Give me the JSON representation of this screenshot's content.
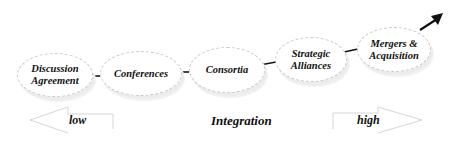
{
  "diagram": {
    "nodes": [
      {
        "id": "discussion",
        "line1": "Discussion",
        "line2": "Agreement"
      },
      {
        "id": "conferences",
        "line1": "Conferences",
        "line2": ""
      },
      {
        "id": "consortia",
        "line1": "Consortia",
        "line2": ""
      },
      {
        "id": "strategic",
        "line1": "Strategic",
        "line2": "Alliances"
      },
      {
        "id": "mergers",
        "line1": "Mergers &",
        "line2": "Acquisition"
      }
    ],
    "axis": {
      "low_label": "low",
      "center_label": "Integration",
      "high_label": "high"
    },
    "colors": {
      "text": "#111111",
      "connector": "#111111",
      "outline": "#c8c8c8",
      "scale_outline": "#d6d6d6"
    }
  }
}
